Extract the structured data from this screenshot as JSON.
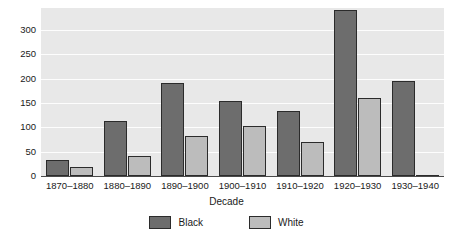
{
  "chart_data": {
    "type": "bar",
    "title": "",
    "xlabel": "Decade",
    "ylabel": "",
    "categories": [
      "1870–1880",
      "1880–1890",
      "1890–1900",
      "1900–1910",
      "1910–1920",
      "1920–1930",
      "1930–1940"
    ],
    "series": [
      {
        "name": "Black",
        "color": "#6d6d6d",
        "values": [
          33,
          113,
          190,
          153,
          134,
          340,
          195
        ]
      },
      {
        "name": "White",
        "color": "#bcbcbc",
        "values": [
          18,
          42,
          82,
          103,
          70,
          161,
          2
        ]
      }
    ],
    "ylim": [
      0,
      345
    ],
    "yticks": [
      0,
      50,
      100,
      150,
      200,
      250,
      300
    ],
    "ytick_labels": [
      "0",
      "50",
      "100",
      "150",
      "200",
      "250",
      "300"
    ],
    "grid": true,
    "grid_axis": "y",
    "legend_position": "bottom",
    "plot_background": "#e8e8e8",
    "gridline_color": "#fdfdfd",
    "axis_color": "#4a4a4a",
    "bar_edge_color": "#2b2b2b"
  }
}
